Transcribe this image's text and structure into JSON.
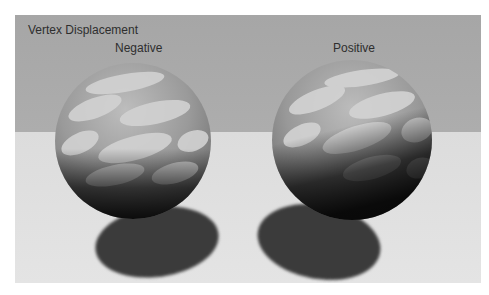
{
  "title": "Vertex Displacement",
  "labels": {
    "negative": "Negative",
    "positive": "Positive"
  },
  "colors": {
    "sky": "#a9a9a9",
    "floor": "#e0e0e0",
    "shadow": "#3b3b3b",
    "text": "#2e2e2e"
  }
}
